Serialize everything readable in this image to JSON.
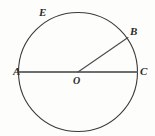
{
  "figure": {
    "background_color": "#fdfdfc",
    "circle": {
      "name": "circle-outline",
      "center_x": 78,
      "center_y": 72,
      "radius": 59.5,
      "stroke_color": "#3a3a3a",
      "stroke_width": 1.1
    },
    "segments": [
      {
        "name": "diameter-ac",
        "from": "A",
        "to": "C",
        "x1": 18.5,
        "y1": 72,
        "x2": 137.5,
        "y2": 72,
        "stroke_color": "#6e6e6e",
        "stroke_width": 1.8
      },
      {
        "name": "radius-ob",
        "from": "O",
        "to": "B",
        "x1": 78,
        "y1": 72,
        "x2": 128,
        "y2": 37.5,
        "stroke_color": "#4a4a4a",
        "stroke_width": 1.1
      }
    ],
    "labels": [
      {
        "id": "A",
        "text": "A",
        "role": "left-endpoint-of-diameter"
      },
      {
        "id": "B",
        "text": "B",
        "role": "point-on-circle-radius-endpoint"
      },
      {
        "id": "C",
        "text": "C",
        "role": "right-endpoint-of-diameter"
      },
      {
        "id": "E",
        "text": "E",
        "role": "point-on-upper-left-arc"
      },
      {
        "id": "O",
        "text": "O",
        "role": "center-of-circle"
      }
    ]
  }
}
